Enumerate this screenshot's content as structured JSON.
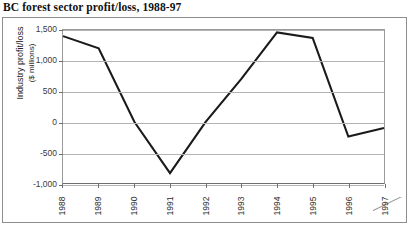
{
  "chart_data": {
    "type": "line",
    "title": "BC forest sector profit/loss, 1988-97",
    "xlabel": "",
    "ylabel": "Industry profit/loss",
    "ylabel_sub": "($ millions)",
    "categories": [
      "1988",
      "1989",
      "1990",
      "1991",
      "1992",
      "1993",
      "1994",
      "1995",
      "1996",
      "1997"
    ],
    "values": [
      1400,
      1200,
      0,
      -840,
      0,
      700,
      1460,
      1370,
      -240,
      -100
    ],
    "series": [
      {
        "name": "Industry profit/loss",
        "values": [
          1400,
          1200,
          0,
          -840,
          0,
          700,
          1460,
          1370,
          -240,
          -100
        ]
      }
    ],
    "ylim": [
      -1000,
      1500
    ],
    "yticks": [
      1500,
      1000,
      500,
      0,
      -500,
      -1000
    ],
    "ytick_labels": [
      "1,500",
      "1,000",
      "500",
      "0",
      "-500",
      "-1,000"
    ],
    "grid": true,
    "legend": "none",
    "line_color": "#1a1a1a",
    "grid_color": "#b4b4b4",
    "axis_color": "#6f6f6f"
  }
}
